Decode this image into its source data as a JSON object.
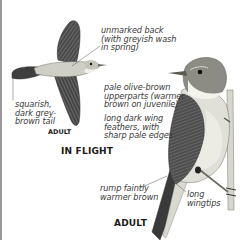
{
  "figure": {
    "in_flight": {
      "heading": "IN FLIGHT",
      "age_label": "ADULT",
      "annotations": [
        {
          "id": "back",
          "text": "unmarked back\n(with greyish wash\nin spring)"
        },
        {
          "id": "tail",
          "text": "squarish,\ndark grey-\nbrown tail"
        }
      ]
    },
    "perched": {
      "age_label": "ADULT",
      "annotations": [
        {
          "id": "upperparts",
          "text": "pale olive-brown\nupperparts (warmer\nbrown on juvenile)"
        },
        {
          "id": "wing-feathers",
          "text": "long dark wing\nfeathers, with\nsharp pale edges"
        },
        {
          "id": "rump",
          "text": "rump faintly\nwarmer brown"
        },
        {
          "id": "wingtips",
          "text": "long\nwingtips"
        }
      ]
    },
    "colors": {
      "border": "#9a9a9a",
      "text": "#3a3a3a",
      "wing_dark": "#3c3c3c",
      "body_pale": "#d8d8d2",
      "stem": "#cfcfc6"
    }
  }
}
